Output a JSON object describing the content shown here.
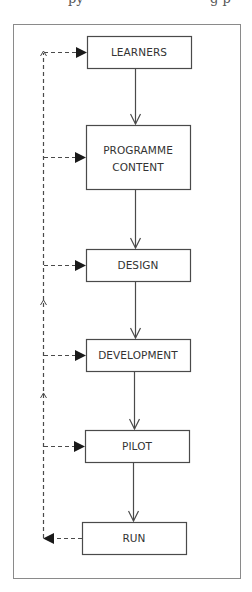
{
  "header_fragment": {
    "left_text": "py",
    "right_text": "g p"
  },
  "diagram": {
    "title": "",
    "colors": {
      "line": "#4a4a4a",
      "frame": "#8a8a8a",
      "text": "#333333",
      "background": "#ffffff"
    },
    "nodes": [
      {
        "id": "learners",
        "label_lines": [
          "LEARNERS"
        ]
      },
      {
        "id": "programme_content",
        "label_lines": [
          "PROGRAMME",
          "CONTENT"
        ]
      },
      {
        "id": "design",
        "label_lines": [
          "DESIGN"
        ]
      },
      {
        "id": "development",
        "label_lines": [
          "DEVELOPMENT"
        ]
      },
      {
        "id": "pilot",
        "label_lines": [
          "PILOT"
        ]
      },
      {
        "id": "run",
        "label_lines": [
          "RUN"
        ]
      }
    ],
    "edges": [
      {
        "from": "learners",
        "to": "programme_content",
        "style": "solid"
      },
      {
        "from": "programme_content",
        "to": "design",
        "style": "solid"
      },
      {
        "from": "design",
        "to": "development",
        "style": "solid"
      },
      {
        "from": "development",
        "to": "pilot",
        "style": "solid"
      },
      {
        "from": "pilot",
        "to": "run",
        "style": "solid"
      }
    ],
    "feedback_loop": {
      "style": "dashed",
      "source": "run",
      "targets": [
        "learners",
        "programme_content",
        "design",
        "development",
        "pilot"
      ]
    }
  }
}
